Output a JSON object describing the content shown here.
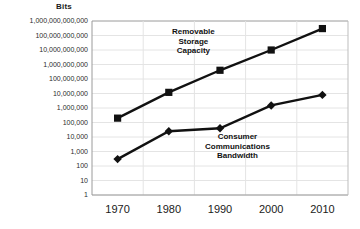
{
  "chart_data": {
    "type": "line",
    "title": "",
    "ylabel": "Bits",
    "xlabel": "",
    "x": [
      1970,
      1980,
      1990,
      2000,
      2010
    ],
    "xtick_labels": [
      "1970",
      "1980",
      "1990",
      "2000",
      "2010"
    ],
    "ytick_labels": [
      "1,000,000,000,000",
      "100,000,000,000",
      "10,000,000,000",
      "1,000,000,000",
      "100,000,000",
      "10,000,000",
      "1,000,000",
      "100,000",
      "10,000",
      "1,000",
      "100",
      "10",
      "1"
    ],
    "yscale": "log",
    "ylim": [
      1,
      1000000000000
    ],
    "grid": true,
    "legend_position": "inline-annotations",
    "series": [
      {
        "name": "Removable Storage Capacity",
        "marker": "square",
        "color": "#111111",
        "values": [
          200000,
          12000000,
          400000000,
          10000000000,
          300000000000
        ],
        "label_lines": [
          "Removable",
          "Storage",
          "Capacity"
        ]
      },
      {
        "name": "Consumer Communications Bandwidth",
        "marker": "diamond",
        "color": "#111111",
        "values": [
          300,
          25000,
          40000,
          1500000,
          8000000
        ],
        "label_lines": [
          "Consumer",
          "Communications",
          "Bandwidth"
        ]
      }
    ]
  }
}
